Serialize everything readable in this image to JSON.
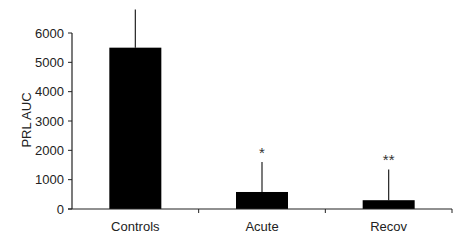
{
  "chart_data": {
    "type": "bar",
    "title": "",
    "xlabel": "",
    "ylabel": "PRL AUC",
    "ylim": [
      0,
      6000
    ],
    "yticks": [
      0,
      1000,
      2000,
      3000,
      4000,
      5000,
      6000
    ],
    "categories": [
      "Controls",
      "Acute",
      "Recov"
    ],
    "values": [
      5500,
      580,
      300
    ],
    "error_upper": [
      6800,
      1600,
      1350
    ],
    "annotations": [
      "",
      "*",
      "**"
    ],
    "bar_color": "#000000",
    "grid": false,
    "legend": null
  }
}
